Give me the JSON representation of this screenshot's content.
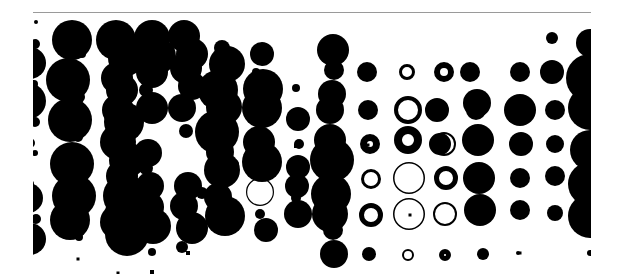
{
  "artwork": {
    "background": "#ffffff",
    "ink": "#000000",
    "rule_color": "#9a9a9a",
    "clip": {
      "x": 33,
      "y": 14,
      "w": 558,
      "h": 260
    },
    "dots": [
      [
        36,
        22,
        2
      ],
      [
        35,
        44,
        5
      ],
      [
        30,
        63,
        16
      ],
      [
        34,
        84,
        4
      ],
      [
        28,
        101,
        18
      ],
      [
        35,
        122,
        5
      ],
      [
        30,
        143,
        5
      ],
      [
        35,
        153,
        3
      ],
      [
        30,
        184,
        4
      ],
      [
        28,
        198,
        15
      ],
      [
        36,
        219,
        5
      ],
      [
        30,
        239,
        16
      ],
      [
        34,
        230,
        4
      ],
      [
        72,
        40,
        20
      ],
      [
        82,
        54,
        4
      ],
      [
        68,
        80,
        22
      ],
      [
        79,
        97,
        6
      ],
      [
        70,
        120,
        22
      ],
      [
        78,
        137,
        5
      ],
      [
        72,
        164,
        22
      ],
      [
        80,
        176,
        5
      ],
      [
        74,
        196,
        22
      ],
      [
        78,
        218,
        5
      ],
      [
        70,
        220,
        20
      ],
      [
        79,
        237,
        4
      ],
      [
        116,
        40,
        20
      ],
      [
        126,
        58,
        18
      ],
      [
        117,
        78,
        16
      ],
      [
        122,
        90,
        16
      ],
      [
        118,
        110,
        16
      ],
      [
        124,
        122,
        20
      ],
      [
        118,
        142,
        18
      ],
      [
        127,
        160,
        18
      ],
      [
        122,
        176,
        16
      ],
      [
        125,
        196,
        22
      ],
      [
        120,
        212,
        15
      ],
      [
        118,
        222,
        18
      ],
      [
        127,
        234,
        22
      ],
      [
        152,
        38,
        18
      ],
      [
        158,
        56,
        18
      ],
      [
        152,
        72,
        16
      ],
      [
        146,
        90,
        7
      ],
      [
        152,
        108,
        16
      ],
      [
        148,
        153,
        14
      ],
      [
        146,
        168,
        7
      ],
      [
        150,
        186,
        14
      ],
      [
        148,
        207,
        16
      ],
      [
        153,
        226,
        18
      ],
      [
        152,
        252,
        4
      ],
      [
        184,
        36,
        16
      ],
      [
        192,
        54,
        16
      ],
      [
        186,
        68,
        16
      ],
      [
        192,
        86,
        14
      ],
      [
        182,
        108,
        14
      ],
      [
        186,
        131,
        7
      ],
      [
        188,
        186,
        14
      ],
      [
        184,
        206,
        14
      ],
      [
        192,
        228,
        16
      ],
      [
        182,
        247,
        6
      ],
      [
        222,
        48,
        8
      ],
      [
        227,
        64,
        18
      ],
      [
        218,
        90,
        20
      ],
      [
        224,
        107,
        18
      ],
      [
        217,
        132,
        22
      ],
      [
        220,
        152,
        14
      ],
      [
        222,
        170,
        18
      ],
      [
        218,
        197,
        14
      ],
      [
        225,
        216,
        20
      ],
      [
        202,
        193,
        6
      ],
      [
        211,
        193,
        5
      ],
      [
        234,
        164,
        5
      ],
      [
        262,
        54,
        12
      ],
      [
        256,
        72,
        4
      ],
      [
        263,
        89,
        20
      ],
      [
        262,
        108,
        20
      ],
      [
        259,
        142,
        16
      ],
      [
        262,
        162,
        20
      ],
      [
        266,
        230,
        12
      ],
      [
        260,
        214,
        5
      ],
      [
        296,
        88,
        4
      ],
      [
        298,
        119,
        12
      ],
      [
        299,
        144,
        5
      ],
      [
        298,
        167,
        12
      ],
      [
        297,
        186,
        12
      ],
      [
        296,
        198,
        5
      ],
      [
        298,
        214,
        14
      ],
      [
        333,
        50,
        16
      ],
      [
        334,
        70,
        10
      ],
      [
        332,
        94,
        14
      ],
      [
        330,
        110,
        14
      ],
      [
        330,
        140,
        16
      ],
      [
        332,
        160,
        22
      ],
      [
        331,
        194,
        20
      ],
      [
        330,
        214,
        18
      ],
      [
        333,
        230,
        10
      ],
      [
        334,
        254,
        14
      ],
      [
        367,
        72,
        10
      ],
      [
        368,
        110,
        10
      ],
      [
        369,
        254,
        7
      ],
      [
        470,
        72,
        10
      ],
      [
        476,
        110,
        10
      ],
      [
        483,
        254,
        6
      ],
      [
        520,
        72,
        10
      ],
      [
        520,
        110,
        16
      ],
      [
        521,
        144,
        12
      ],
      [
        520,
        178,
        10
      ],
      [
        520,
        210,
        10
      ],
      [
        552,
        38,
        6
      ],
      [
        552,
        72,
        12
      ],
      [
        555,
        110,
        10
      ],
      [
        555,
        144,
        9
      ],
      [
        555,
        176,
        10
      ],
      [
        555,
        213,
        8
      ],
      [
        590,
        43,
        14
      ],
      [
        590,
        78,
        24
      ],
      [
        590,
        108,
        22
      ],
      [
        590,
        150,
        20
      ],
      [
        590,
        184,
        22
      ],
      [
        590,
        216,
        22
      ],
      [
        590,
        253,
        3
      ],
      [
        477,
        103,
        14
      ],
      [
        478,
        140,
        16
      ],
      [
        479,
        178,
        16
      ],
      [
        480,
        210,
        16
      ],
      [
        517,
        74,
        1.5
      ],
      [
        518,
        253,
        2
      ]
    ],
    "rings": [
      [
        407,
        72,
        8,
        3
      ],
      [
        408,
        110,
        14,
        4
      ],
      [
        408,
        140,
        14,
        8
      ],
      [
        409,
        178,
        16,
        1.5
      ],
      [
        409,
        214,
        16,
        1.5
      ],
      [
        408,
        255,
        6,
        2
      ],
      [
        444,
        72,
        10,
        6
      ],
      [
        444,
        144,
        12,
        2
      ],
      [
        446,
        178,
        12,
        5
      ],
      [
        445,
        214,
        12,
        2
      ],
      [
        445,
        255,
        6,
        5
      ],
      [
        370,
        144,
        10,
        7
      ],
      [
        371,
        179,
        10,
        3
      ],
      [
        371,
        215,
        12,
        5
      ],
      [
        260,
        192,
        14,
        1.2
      ],
      [
        437,
        110,
        12,
        12
      ],
      [
        440,
        144,
        11,
        11
      ]
    ],
    "squares": [
      [
        188,
        253,
        4
      ],
      [
        118,
        273,
        3
      ],
      [
        152,
        272,
        4
      ],
      [
        296,
        146,
        4
      ],
      [
        78,
        259,
        3
      ],
      [
        80,
        236,
        3
      ],
      [
        520,
        253,
        3
      ],
      [
        410,
        215,
        3
      ],
      [
        368,
        145,
        3
      ],
      [
        369,
        72,
        3
      ]
    ]
  }
}
